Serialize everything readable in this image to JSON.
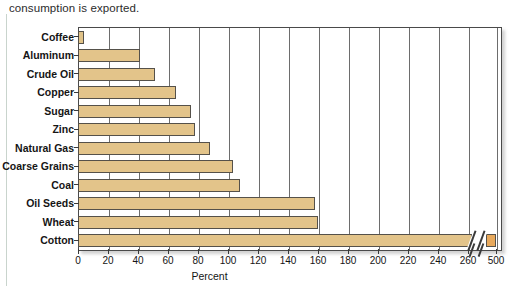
{
  "caption": "consumption is exported.",
  "chart_data": {
    "type": "bar",
    "orientation": "horizontal",
    "title": "",
    "xlabel": "Percent",
    "ylabel": "",
    "grid": true,
    "legend": null,
    "xlim": [
      0,
      280
    ],
    "axis_break": {
      "present": true,
      "after_tick": 260,
      "resume_tick": 500,
      "style": "double-slash"
    },
    "xticks": [
      0,
      20,
      40,
      60,
      80,
      100,
      120,
      140,
      160,
      180,
      200,
      220,
      240,
      260,
      500
    ],
    "categories": [
      "Coffee",
      "Aluminum",
      "Crude Oil",
      "Copper",
      "Sugar",
      "Zinc",
      "Natural Gas",
      "Coarse Grains",
      "Coal",
      "Oil Seeds",
      "Wheat",
      "Cotton"
    ],
    "values": [
      4,
      41,
      51,
      65,
      75,
      78,
      88,
      103,
      108,
      158,
      160,
      500
    ],
    "bar_color": "#e3c48a",
    "bar_edge_color": "#55514a"
  }
}
